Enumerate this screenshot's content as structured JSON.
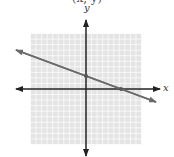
{
  "caption_fragment": "(x, y)",
  "colors": {
    "grid_fill": "#e4e4e4",
    "grid_line": "#ffffff",
    "axis": "#222222",
    "line": "#6a6a6a",
    "point": "#555555"
  },
  "chart_data": {
    "type": "line",
    "title": "",
    "xlabel": "x",
    "ylabel": "y",
    "xlim": [
      -10,
      10
    ],
    "ylim": [
      -10,
      10
    ],
    "grid": true,
    "grid_step": 1,
    "tick_labels": false,
    "legend": null,
    "series": [
      {
        "name": "line",
        "equation": "y = -x/3 + 2 (approximate)",
        "slope": -0.333,
        "intercept": 2,
        "points": [
          {
            "x": 0,
            "y": 2,
            "label": "y-intercept (approx.)"
          },
          {
            "x": 6,
            "y": 0,
            "label": "x-intercept (approx.)"
          }
        ],
        "arrows_both_ends": true
      }
    ],
    "note": "Intercepts read from pixels (~2.4 and ~6.3 units); exact values uncertain by about 1 unit"
  }
}
